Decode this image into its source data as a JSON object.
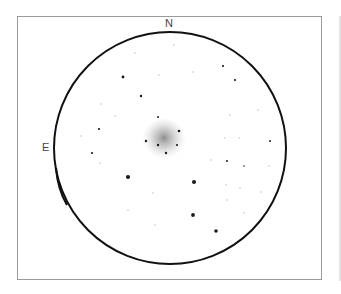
{
  "sketch": {
    "type": "eyepiece-field-sketch",
    "orientation_labels": {
      "north": "N",
      "east": "E"
    },
    "field_circle": {
      "cx": 170,
      "cy": 148,
      "r": 116,
      "stroke": "#111111"
    },
    "nebula": {
      "cx": 164,
      "cy": 140,
      "rx": 22,
      "ry": 21,
      "color": "#7a7a7a"
    },
    "stars": [
      {
        "x": 123,
        "y": 77,
        "r": 1.4
      },
      {
        "x": 141,
        "y": 96,
        "r": 1.2
      },
      {
        "x": 223,
        "y": 66,
        "r": 1.1
      },
      {
        "x": 235,
        "y": 80,
        "r": 1.1
      },
      {
        "x": 158,
        "y": 117,
        "r": 1.0
      },
      {
        "x": 179,
        "y": 131,
        "r": 1.3
      },
      {
        "x": 146,
        "y": 141,
        "r": 1.2
      },
      {
        "x": 158,
        "y": 145,
        "r": 1.2
      },
      {
        "x": 177,
        "y": 145,
        "r": 1.1
      },
      {
        "x": 166,
        "y": 153,
        "r": 1.2
      },
      {
        "x": 99,
        "y": 129,
        "r": 1.1
      },
      {
        "x": 92,
        "y": 153,
        "r": 1.1
      },
      {
        "x": 128,
        "y": 177,
        "r": 2.1
      },
      {
        "x": 194,
        "y": 182,
        "r": 2.0
      },
      {
        "x": 193,
        "y": 215,
        "r": 1.9
      },
      {
        "x": 216,
        "y": 231,
        "r": 1.8
      },
      {
        "x": 227,
        "y": 161,
        "r": 1.0
      },
      {
        "x": 270,
        "y": 141,
        "r": 1.0
      },
      {
        "x": 244,
        "y": 166,
        "r": 0.8
      }
    ],
    "faint_stars": [
      {
        "x": 135,
        "y": 53
      },
      {
        "x": 174,
        "y": 45
      },
      {
        "x": 193,
        "y": 72
      },
      {
        "x": 159,
        "y": 75
      },
      {
        "x": 101,
        "y": 104
      },
      {
        "x": 115,
        "y": 116
      },
      {
        "x": 81,
        "y": 136
      },
      {
        "x": 100,
        "y": 163
      },
      {
        "x": 230,
        "y": 115
      },
      {
        "x": 258,
        "y": 110
      },
      {
        "x": 239,
        "y": 138
      },
      {
        "x": 225,
        "y": 138
      },
      {
        "x": 211,
        "y": 160
      },
      {
        "x": 269,
        "y": 166
      },
      {
        "x": 226,
        "y": 185
      },
      {
        "x": 240,
        "y": 188
      },
      {
        "x": 261,
        "y": 192
      },
      {
        "x": 153,
        "y": 193
      },
      {
        "x": 227,
        "y": 200
      },
      {
        "x": 128,
        "y": 210
      },
      {
        "x": 155,
        "y": 225
      },
      {
        "x": 244,
        "y": 213
      }
    ]
  }
}
